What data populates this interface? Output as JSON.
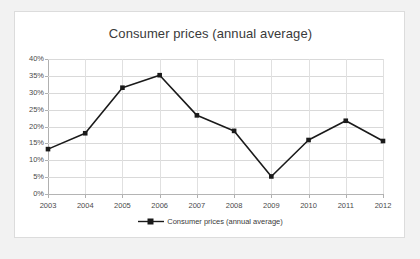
{
  "chart_data": {
    "type": "line",
    "title": "Consumer prices (annual average)",
    "xlabel": "",
    "ylabel": "",
    "categories": [
      "2003",
      "2004",
      "2005",
      "2006",
      "2007",
      "2008",
      "2009",
      "2010",
      "2011",
      "2012"
    ],
    "values": [
      13.3,
      18.0,
      31.5,
      35.2,
      23.3,
      18.7,
      5.2,
      16.0,
      21.7,
      15.7
    ],
    "series": [
      {
        "name": "Consumer prices (annual average)",
        "values": [
          13.3,
          18.0,
          31.5,
          35.2,
          23.3,
          18.7,
          5.2,
          16.0,
          21.7,
          15.7
        ]
      }
    ],
    "ylim": [
      0,
      40
    ],
    "ytick_labels": [
      "0%",
      "5%",
      "10%",
      "15%",
      "20%",
      "25%",
      "30%",
      "35%",
      "40%"
    ],
    "ytick_values": [
      0,
      5,
      10,
      15,
      20,
      25,
      30,
      35,
      40
    ],
    "grid": true,
    "legend_position": "bottom",
    "legend_entries": [
      "Consumer prices (annual average)"
    ],
    "marker": "square",
    "line_color": "#1a1a1a",
    "marker_color": "#1a1a1a",
    "grid_color": "#d9d9d9",
    "plot_background": "#ffffff",
    "page_background": "#f2f2f2"
  },
  "legend": {
    "label": "Consumer prices (annual average)"
  }
}
